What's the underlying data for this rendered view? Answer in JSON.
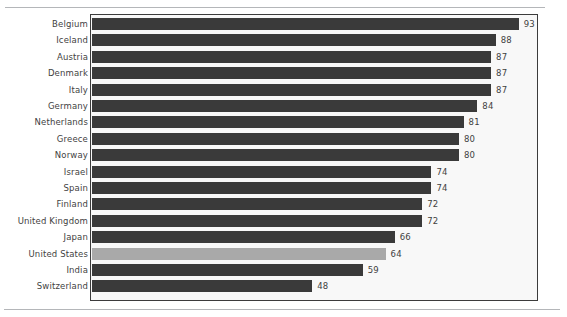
{
  "chart_data": {
    "type": "bar",
    "orientation": "horizontal",
    "title": "",
    "subtitle": "",
    "xlabel": "",
    "ylabel": "",
    "xlim": [
      0,
      97
    ],
    "grid": false,
    "legend": null,
    "value_labels_shown": true,
    "categories": [
      "Belgium",
      "Iceland",
      "Austria",
      "Denmark",
      "Italy",
      "Germany",
      "Netherlands",
      "Greece",
      "Norway",
      "Israel",
      "Spain",
      "Finland",
      "United Kingdom",
      "Japan",
      "United States",
      "India",
      "Switzerland"
    ],
    "values": [
      93,
      88,
      87,
      87,
      87,
      84,
      81,
      80,
      80,
      74,
      74,
      72,
      72,
      66,
      64,
      59,
      48
    ],
    "highlighted_category": "United States",
    "colors": {
      "bar": "#3a3a3a",
      "bar_highlight": "#a9a9a9",
      "plot_background": "#f8f8f8",
      "frame": "#3c3c3c",
      "text": "#3f3f3f",
      "rule": "#b4b6b9",
      "page_background": "#ffffff"
    }
  }
}
